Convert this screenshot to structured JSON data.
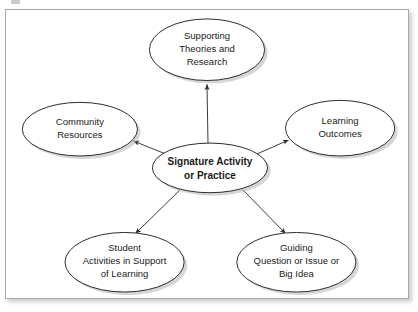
{
  "figure": {
    "frame": {
      "border_color": "#a9a9ac",
      "background": "#ffffff",
      "shadow_color": "#82828733"
    }
  },
  "diagram": {
    "type": "hub-and-spoke concept map",
    "center_node": {
      "id": "signature-activity",
      "label_lines": [
        "Signature Activity",
        "or Practice"
      ],
      "bold": true,
      "shape": "ellipse",
      "cx": 205,
      "cy": 159,
      "rx": 58,
      "ry": 25
    },
    "outer_nodes": [
      {
        "id": "supporting-theories",
        "label_lines": [
          "Supporting",
          "Theories and",
          "Research"
        ],
        "shape": "ellipse",
        "cx": 202,
        "cy": 40,
        "rx": 58,
        "ry": 31
      },
      {
        "id": "community-resources",
        "label_lines": [
          "Community",
          "Resources"
        ],
        "shape": "ellipse",
        "cx": 74,
        "cy": 120,
        "rx": 58,
        "ry": 27
      },
      {
        "id": "learning-outcomes",
        "label_lines": [
          "Learning",
          "Outcomes"
        ],
        "shape": "ellipse",
        "cx": 336,
        "cy": 119,
        "rx": 55,
        "ry": 28
      },
      {
        "id": "student-activities",
        "label_lines": [
          "Student",
          "Activities in Support",
          "of Learning"
        ],
        "shape": "ellipse",
        "cx": 119,
        "cy": 254,
        "rx": 60,
        "ry": 30
      },
      {
        "id": "guiding-question",
        "label_lines": [
          "Guiding",
          "Question or Issue or",
          "Big Idea"
        ],
        "shape": "ellipse",
        "cx": 292,
        "cy": 254,
        "rx": 60,
        "ry": 30
      }
    ],
    "connectors": [
      {
        "id": "arrow-to-supporting-theories",
        "from": "signature-activity",
        "to": "supporting-theories",
        "arrowhead": "target",
        "x1": 203,
        "y1": 134,
        "x2": 202,
        "y2": 74
      },
      {
        "id": "arrow-to-community-resources",
        "from": "signature-activity",
        "to": "community-resources",
        "arrowhead": "target",
        "x1": 163,
        "y1": 146,
        "x2": 126,
        "y2": 131
      },
      {
        "id": "arrow-to-learning-outcomes",
        "from": "signature-activity",
        "to": "learning-outcomes",
        "arrowhead": "target",
        "x1": 250,
        "y1": 146,
        "x2": 285,
        "y2": 130
      },
      {
        "id": "arrow-to-student-activities",
        "from": "signature-activity",
        "to": "student-activities",
        "arrowhead": "target",
        "x1": 175,
        "y1": 181,
        "x2": 131,
        "y2": 226
      },
      {
        "id": "arrow-to-guiding-question",
        "from": "signature-activity",
        "to": "guiding-question",
        "arrowhead": "target",
        "x1": 238,
        "y1": 181,
        "x2": 281,
        "y2": 226
      }
    ]
  }
}
